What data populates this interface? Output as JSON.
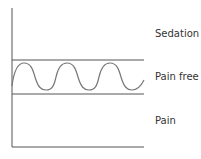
{
  "diagram": {
    "zones": [
      {
        "label": "Sedation",
        "position": "top"
      },
      {
        "label": "Pain free",
        "position": "middle"
      },
      {
        "label": "Pain",
        "position": "bottom"
      }
    ],
    "curve": "oscillating wave within pain-free band",
    "colors": {
      "line": "#555555",
      "wave": "#777777",
      "text": "#333333"
    }
  }
}
